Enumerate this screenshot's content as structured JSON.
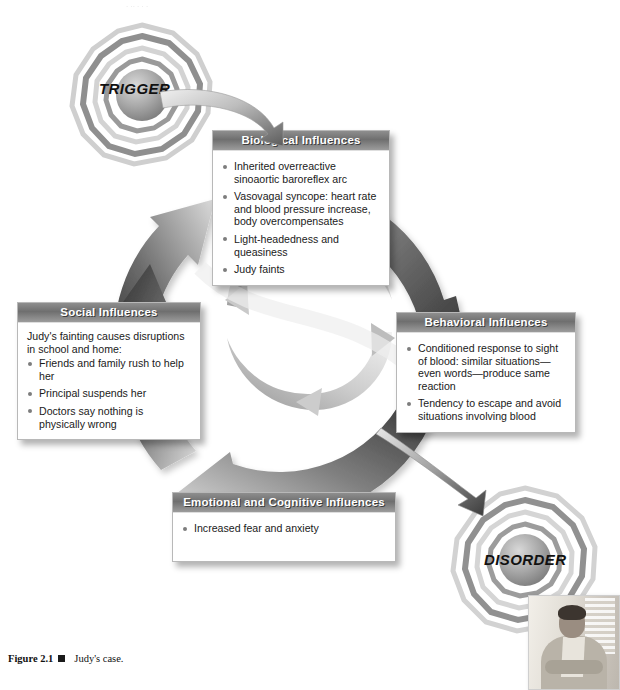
{
  "figure": {
    "number": "Figure 2.1",
    "marker_icon": "filled-square-icon",
    "caption": "Judy's case."
  },
  "nodes": [
    {
      "id": "trigger",
      "label": "TRIGGER",
      "icon": "concentric-ripple-sphere-icon"
    },
    {
      "id": "disorder",
      "label": "DISORDER",
      "icon": "concentric-ripple-sphere-icon"
    }
  ],
  "photo": {
    "alt_name": "photo-of-man-seated",
    "icon": "person-photo-icon"
  },
  "boxes": {
    "biological": {
      "title": "Biological Influences",
      "intro": "",
      "items": [
        "Inherited overreactive sinoaortic baroreflex arc",
        "Vasovagal syncope: heart rate and blood pressure increase, body overcompensates",
        "Light-headedness and queasiness",
        "Judy faints"
      ]
    },
    "social": {
      "title": "Social Influences",
      "intro": "Judy's fainting causes disruptions in school and home:",
      "items": [
        "Friends and family rush to help her",
        "Principal suspends her",
        "Doctors say nothing is physically wrong"
      ]
    },
    "behavioral": {
      "title": "Behavioral Influences",
      "intro": "",
      "items": [
        "Conditioned response to sight of blood: similar situations—even words—produce same reaction",
        "Tendency to escape and avoid situations involving blood"
      ]
    },
    "emotional": {
      "title": "Emotional and Cognitive Influences",
      "intro": "",
      "items": [
        "Increased fear and anxiety"
      ]
    }
  },
  "arrows": {
    "entry_label": "trigger-to-biological-arrow",
    "exit_label": "behavioral-to-disorder-arrow",
    "outer_ring_label": "outer-cycle-arrows",
    "inner_ring_label": "inner-cycle-arrows"
  },
  "colors": {
    "header_dark": "#6f6f6f",
    "header_light": "#9c9c9c",
    "header_text": "#ffffff",
    "body_text": "#1a1a1a",
    "bullet": "#7d7d7d",
    "arrow_dark": "#3b3b3b",
    "arrow_light": "#e8e8e8",
    "page_bg": "#ffffff"
  },
  "top_remnant": ". .. . . ."
}
